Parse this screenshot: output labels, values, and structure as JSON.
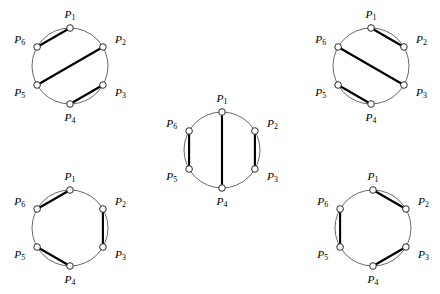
{
  "figure": {
    "point_labels": [
      "P1",
      "P2",
      "P3",
      "P4",
      "P5",
      "P6"
    ],
    "label_base": "P",
    "label_subscripts": [
      "1",
      "2",
      "3",
      "4",
      "5",
      "6"
    ],
    "colors": {
      "background": "#ffffff",
      "circle_stroke": "#585858",
      "chord_stroke": "#000000",
      "vertex_fill": "#ffffff",
      "vertex_stroke": "#2a2a2a",
      "label_color": "#000000"
    },
    "geometry": {
      "vertex_angles_deg": [
        90,
        30,
        330,
        270,
        210,
        150
      ],
      "vertex_radius_px": 3.3,
      "note": "P1 at top, indices increase clockwise"
    }
  },
  "chart_data": {
    "type": "diagram",
    "vertices": [
      {
        "id": "P1",
        "label": "P",
        "subscript": "1",
        "angle_deg": 90,
        "label_position": "top"
      },
      {
        "id": "P2",
        "label": "P",
        "subscript": "2",
        "angle_deg": 30,
        "label_position": "upper-right"
      },
      {
        "id": "P3",
        "label": "P",
        "subscript": "3",
        "angle_deg": 330,
        "label_position": "lower-right"
      },
      {
        "id": "P4",
        "label": "P",
        "subscript": "4",
        "angle_deg": 270,
        "label_position": "bottom"
      },
      {
        "id": "P5",
        "label": "P",
        "subscript": "5",
        "angle_deg": 210,
        "label_position": "lower-left"
      },
      {
        "id": "P6",
        "label": "P",
        "subscript": "6",
        "angle_deg": 150,
        "label_position": "upper-left"
      }
    ],
    "diagrams": [
      {
        "name": "top-left",
        "position": "top-left",
        "cx": 70,
        "cy": 66,
        "r": 38,
        "matching": [
          [
            "P1",
            "P6"
          ],
          [
            "P2",
            "P5"
          ],
          [
            "P3",
            "P4"
          ]
        ],
        "crossing": false
      },
      {
        "name": "top-right",
        "position": "top-right",
        "cx": 371,
        "cy": 66,
        "r": 38,
        "matching": [
          [
            "P1",
            "P2"
          ],
          [
            "P6",
            "P3"
          ],
          [
            "P5",
            "P4"
          ]
        ],
        "crossing": false
      },
      {
        "name": "center",
        "position": "center",
        "cx": 222,
        "cy": 150,
        "r": 38,
        "matching": [
          [
            "P1",
            "P4"
          ],
          [
            "P6",
            "P5"
          ],
          [
            "P2",
            "P3"
          ]
        ],
        "crossing": false
      },
      {
        "name": "bottom-left",
        "position": "bottom-left",
        "cx": 70,
        "cy": 228,
        "r": 38,
        "matching": [
          [
            "P1",
            "P6"
          ],
          [
            "P2",
            "P3"
          ],
          [
            "P5",
            "P4"
          ]
        ],
        "crossing": false
      },
      {
        "name": "bottom-right",
        "position": "bottom-right",
        "cx": 373,
        "cy": 228,
        "r": 38,
        "matching": [
          [
            "P1",
            "P2"
          ],
          [
            "P6",
            "P5"
          ],
          [
            "P4",
            "P3"
          ]
        ],
        "crossing": false
      }
    ],
    "total_diagrams": 5,
    "xlabel": "",
    "ylabel": ""
  }
}
